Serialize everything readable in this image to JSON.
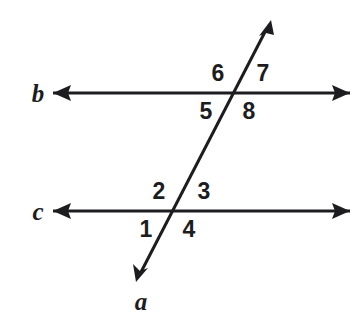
{
  "figure": {
    "background_color": "#ffffff",
    "stroke_color": "#1d1d20",
    "width": 363,
    "height": 319
  },
  "lines": [
    {
      "id": "line-b",
      "label": "b",
      "label_x": 38,
      "label_y": 93,
      "kind": "horizontal",
      "arrowheads": "both",
      "x1": 53,
      "y1": 93,
      "x2": 350,
      "y2": 93
    },
    {
      "id": "line-c",
      "label": "c",
      "label_x": 38,
      "label_y": 211,
      "kind": "horizontal",
      "arrowheads": "both",
      "x1": 53,
      "y1": 211,
      "x2": 350,
      "y2": 211
    },
    {
      "id": "line-a",
      "label": "a",
      "label_x": 141,
      "label_y": 301,
      "kind": "transversal",
      "arrowheads": "both",
      "x1": 271,
      "y1": 20,
      "x2": 136,
      "y2": 282
    }
  ],
  "intersections": [
    {
      "id": "intersection-b",
      "line": "b",
      "x": 233,
      "y": 93
    },
    {
      "id": "intersection-c",
      "line": "c",
      "x": 172,
      "y": 211
    }
  ],
  "angle_labels": [
    {
      "id": "angle-6",
      "text": "6",
      "x": 218,
      "y": 73,
      "position": "above-left-of-b"
    },
    {
      "id": "angle-7",
      "text": "7",
      "x": 263,
      "y": 73,
      "position": "above-right-of-b"
    },
    {
      "id": "angle-5",
      "text": "5",
      "x": 206,
      "y": 111,
      "position": "below-left-of-b"
    },
    {
      "id": "angle-8",
      "text": "8",
      "x": 249,
      "y": 111,
      "position": "below-right-of-b"
    },
    {
      "id": "angle-2",
      "text": "2",
      "x": 159,
      "y": 191,
      "position": "above-left-of-c"
    },
    {
      "id": "angle-3",
      "text": "3",
      "x": 204,
      "y": 191,
      "position": "above-right-of-c"
    },
    {
      "id": "angle-1",
      "text": "1",
      "x": 146,
      "y": 229,
      "position": "below-left-of-c"
    },
    {
      "id": "angle-4",
      "text": "4",
      "x": 189,
      "y": 229,
      "position": "below-right-of-c"
    }
  ]
}
